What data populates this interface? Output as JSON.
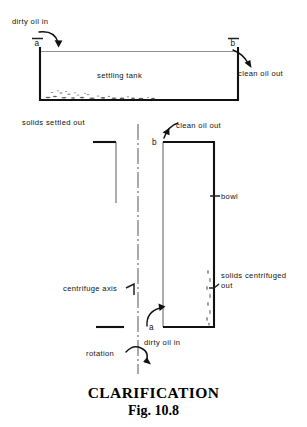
{
  "figure": {
    "title": "CLARIFICATION",
    "figure_number": "Fig. 10.8",
    "type": "engineering-schematic"
  },
  "settling_tank": {
    "body_label": "settling tank",
    "inlet_label": "dirty oil in",
    "outlet_label": "clean oil out",
    "point_a": "a",
    "point_b": "b",
    "solids_label": "solids settled out"
  },
  "centrifuge": {
    "bowl_label": "bowl",
    "axis_label": "centrifuge axis",
    "inlet_label": "dirty oil in",
    "outlet_label": "clean oil out",
    "solids_label_line1": "solids centrifuged",
    "solids_label_line2": "out",
    "rotation_label": "rotation",
    "point_a": "a",
    "point_b": "b"
  },
  "colors": {
    "ink": "#111111",
    "light_ink": "#5c5c5c",
    "paper": "#ffffff",
    "centerline": "#555555"
  }
}
